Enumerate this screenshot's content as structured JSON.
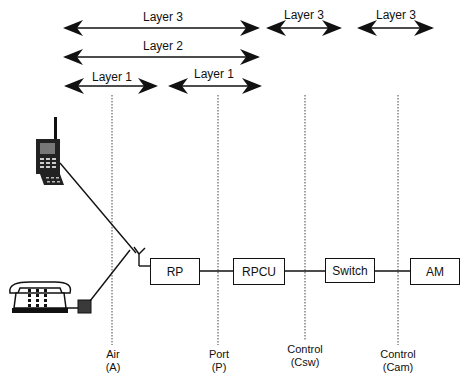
{
  "diagram": {
    "layer_arrows": [
      {
        "id": "layer3-air-to-port",
        "label": "Layer 3"
      },
      {
        "id": "layer3-port-to-csw",
        "label": "Layer 3"
      },
      {
        "id": "layer3-csw-to-cam",
        "label": "Layer 3"
      },
      {
        "id": "layer2-air-to-port",
        "label": "Layer 2"
      },
      {
        "id": "layer1-air",
        "label": "Layer 1"
      },
      {
        "id": "layer1-port",
        "label": "Layer 1"
      }
    ],
    "nodes": [
      {
        "id": "rp",
        "label": "RP"
      },
      {
        "id": "rpcu",
        "label": "RPCU"
      },
      {
        "id": "switch",
        "label": "Switch"
      },
      {
        "id": "am",
        "label": "AM"
      }
    ],
    "terminals": [
      {
        "id": "portable-handset",
        "icon": "mobile-phone-icon"
      },
      {
        "id": "fixed-telephone",
        "icon": "desk-telephone-icon"
      }
    ],
    "interfaces": [
      {
        "id": "air",
        "line1": "Air",
        "line2": "(A)"
      },
      {
        "id": "port",
        "line1": "Port",
        "line2": "(P)"
      },
      {
        "id": "control-csw",
        "line1": "Control",
        "line2": "(Csw)"
      },
      {
        "id": "control-cam",
        "line1": "Control",
        "line2": "(Cam)"
      }
    ],
    "colors": {
      "stroke": "#111111",
      "fill_dark": "#3a3a3a",
      "background": "#ffffff"
    }
  }
}
